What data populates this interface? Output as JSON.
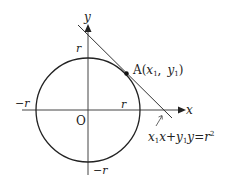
{
  "diagram": {
    "type": "circle-tangent",
    "axes": {
      "x_label": "x",
      "y_label": "y",
      "origin_label": "O"
    },
    "intercepts": {
      "pos_y": "r",
      "neg_y": "−r",
      "pos_x": "r",
      "neg_x": "−r"
    },
    "point": {
      "name": "A",
      "coords_open": "(",
      "x": "x",
      "x_sub": "1",
      "sep": ",",
      "y": "y",
      "y_sub": "1",
      "coords_close": ")"
    },
    "tangent_equation": {
      "a": "x",
      "a_sub": "1",
      "b": "x",
      "plus": "+",
      "c": "y",
      "c_sub": "1",
      "d": "y",
      "eq": "=",
      "rhs": "r",
      "rhs_sup": "2"
    },
    "colors": {
      "stroke": "#222222",
      "axis": "#444444",
      "background": "#ffffff"
    }
  }
}
